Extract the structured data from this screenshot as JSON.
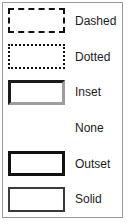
{
  "panel": {
    "title": "Border style samples",
    "border_color": "#9a9a9a",
    "background": "#ffffff"
  },
  "rows": [
    {
      "label": "Dashed",
      "style": "dashed",
      "swatch_name": "border-sample-dashed",
      "border_color": "#111111",
      "border_width": "2px"
    },
    {
      "label": "Dotted",
      "style": "dotted",
      "swatch_name": "border-sample-dotted",
      "border_color": "#111111",
      "border_width": "2px"
    },
    {
      "label": "Inset",
      "style": "inset",
      "swatch_name": "border-sample-inset",
      "border_color": "#1a1a1a",
      "border_shadow_color": "#9d9d9d",
      "border_width": "3px"
    },
    {
      "label": "None",
      "style": "none",
      "swatch_name": "border-sample-none",
      "border_color": "transparent",
      "border_width": "0px"
    },
    {
      "label": "Outset",
      "style": "outset",
      "swatch_name": "border-sample-outset",
      "border_color": "#111111",
      "border_width": "3px"
    },
    {
      "label": "Solid",
      "style": "solid",
      "swatch_name": "border-sample-solid",
      "border_color": "#3a3a3a",
      "border_width": "2px"
    }
  ]
}
